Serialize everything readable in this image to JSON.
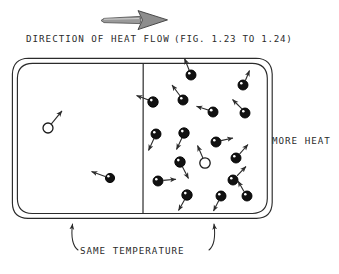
{
  "figure": {
    "title_label": "DIRECTION OF HEAT FLOW",
    "figure_reference": "(FIG. 1.23 TO 1.24)",
    "right_label": "MORE HEAT",
    "bottom_label": "SAME TEMPERATURE",
    "flow_arrow_icon": "right-arrow-icon",
    "colors": {
      "ink": "#2b2b2b",
      "particle_fill": "#111111",
      "particle_stroke": "#000000",
      "background": "#ffffff",
      "arrow_fill": "#777777"
    },
    "container": {
      "x": 12,
      "y": 58,
      "width": 260,
      "height": 160,
      "corner_radius": 16,
      "double_border_offset": 5,
      "divider_x": 143
    },
    "flow_arrow": {
      "x1": 100,
      "y1": 20,
      "x2": 168,
      "y2": 20
    },
    "left_chamber": {
      "name": "cooler-chamber",
      "particle_count": 2,
      "particles": [
        {
          "cx": 48,
          "cy": 128,
          "r": 5.0,
          "filled": false,
          "vx": 0.62,
          "vy": -0.78,
          "len": 19
        },
        {
          "cx": 110,
          "cy": 178,
          "r": 4.6,
          "filled": true,
          "vx": -0.93,
          "vy": -0.36,
          "len": 17
        }
      ]
    },
    "right_chamber": {
      "name": "hotter-chamber",
      "particle_count": 19,
      "particles": [
        {
          "cx": 191,
          "cy": 75,
          "r": 5.0,
          "filled": true,
          "vx": -0.35,
          "vy": -0.94,
          "len": 17
        },
        {
          "cx": 243,
          "cy": 85,
          "r": 5.0,
          "filled": true,
          "vx": 0.45,
          "vy": -0.89,
          "len": 16
        },
        {
          "cx": 153,
          "cy": 102,
          "r": 5.2,
          "filled": true,
          "vx": -0.9,
          "vy": -0.44,
          "len": 17
        },
        {
          "cx": 183,
          "cy": 100,
          "r": 5.0,
          "filled": true,
          "vx": 0.42,
          "vy": 0.91,
          "len": 17
        },
        {
          "cx": 213,
          "cy": 112,
          "r": 5.0,
          "filled": true,
          "vx": -0.94,
          "vy": -0.34,
          "len": 18
        },
        {
          "cx": 245,
          "cy": 113,
          "r": 5.0,
          "filled": true,
          "vx": -0.7,
          "vy": -0.71,
          "len": 19
        },
        {
          "cx": 156,
          "cy": 134,
          "r": 5.0,
          "filled": true,
          "vx": -0.48,
          "vy": 0.88,
          "len": 18
        },
        {
          "cx": 184,
          "cy": 133,
          "r": 5.2,
          "filled": true,
          "vx": -0.55,
          "vy": 0.84,
          "len": 18
        },
        {
          "cx": 216,
          "cy": 142,
          "r": 5.0,
          "filled": true,
          "vx": 0.97,
          "vy": -0.25,
          "len": 17
        },
        {
          "cx": 180,
          "cy": 162,
          "r": 5.2,
          "filled": true,
          "vx": 0.42,
          "vy": 0.91,
          "len": 19
        },
        {
          "cx": 205,
          "cy": 163,
          "r": 5.2,
          "filled": false,
          "vx": -0.47,
          "vy": -0.88,
          "len": 19
        },
        {
          "cx": 236,
          "cy": 158,
          "r": 5.0,
          "filled": true,
          "vx": 0.68,
          "vy": -0.73,
          "len": 17
        },
        {
          "cx": 158,
          "cy": 181,
          "r": 5.0,
          "filled": true,
          "vx": 0.98,
          "vy": -0.1,
          "len": 18
        },
        {
          "cx": 233,
          "cy": 180,
          "r": 5.0,
          "filled": true,
          "vx": 0.72,
          "vy": 0.69,
          "len": 17
        },
        {
          "cx": 187,
          "cy": 195,
          "r": 5.2,
          "filled": true,
          "vx": -0.55,
          "vy": 0.84,
          "len": 18
        },
        {
          "cx": 221,
          "cy": 196,
          "r": 5.0,
          "filled": true,
          "vx": -0.43,
          "vy": 0.9,
          "len": 18
        },
        {
          "cx": 243,
          "cy": 193,
          "r": 5.0,
          "filled": true,
          "vx": -0.62,
          "vy": -0.78,
          "len": 17
        },
        {
          "cx": 247,
          "cy": 200,
          "r": 5.0,
          "filled": true,
          "vx": 0.3,
          "vy": 0.95,
          "len": 14
        },
        {
          "cx": 208,
          "cy": 82,
          "r": 0.0,
          "filled": true,
          "vx": 0.0,
          "vy": 0.0,
          "len": 0
        }
      ]
    },
    "bottom_bracket": {
      "left_arrow_x": 73,
      "right_arrow_x": 213,
      "arrow_tip_y": 224,
      "arrow_base_y": 250
    }
  }
}
